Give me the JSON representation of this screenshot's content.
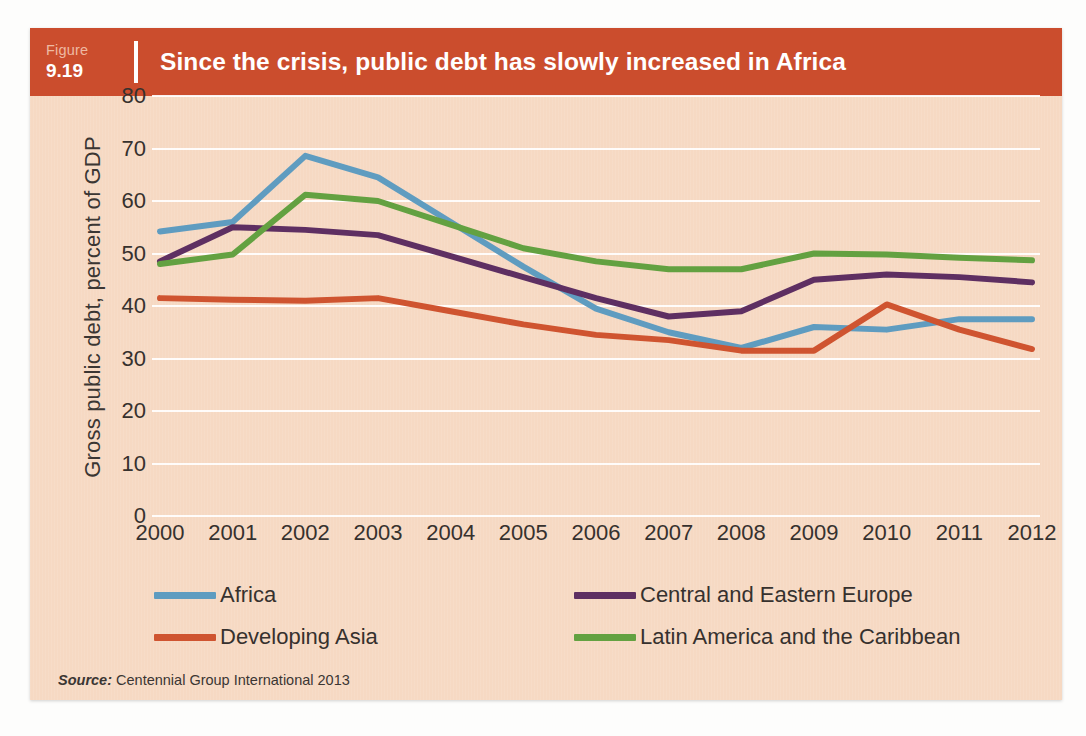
{
  "figure": {
    "label_word": "Figure",
    "number": "9.19",
    "title": "Since the crisis, public debt has slowly increased in Africa"
  },
  "source": {
    "prefix": "Source:",
    "text": "Centennial Group International 2013"
  },
  "colors": {
    "header_band": "#cb4d2d",
    "panel_background": "#f6d9c3",
    "gridline": "#ffffff",
    "africa": "#5f9cc0",
    "central_eastern_europe": "#5e2f62",
    "developing_asia": "#cf5430",
    "latin_america_caribbean": "#63a141"
  },
  "chart_data": {
    "type": "line",
    "title": "Since the crisis, public debt has slowly increased in Africa",
    "xlabel": "",
    "ylabel": "Gross public debt, percent of GDP",
    "grid": true,
    "legend_position": "bottom",
    "ylim": [
      0,
      80
    ],
    "yticks": [
      80,
      70,
      60,
      50,
      40,
      30,
      20,
      10,
      0
    ],
    "categories": [
      "2000",
      "2001",
      "2002",
      "2003",
      "2004",
      "2005",
      "2006",
      "2007",
      "2008",
      "2009",
      "2010",
      "2011",
      "2012"
    ],
    "x": [
      2000,
      2001,
      2002,
      2003,
      2004,
      2005,
      2006,
      2007,
      2008,
      2009,
      2010,
      2011,
      2012
    ],
    "series": [
      {
        "name": "Africa",
        "color": "#5f9cc0",
        "values": [
          54.2,
          56.0,
          68.6,
          64.5,
          56.0,
          47.5,
          39.5,
          35.0,
          32.0,
          36.0,
          35.5,
          37.5,
          37.5
        ]
      },
      {
        "name": "Central and Eastern Europe",
        "color": "#5e2f62",
        "values": [
          48.5,
          55.0,
          54.5,
          53.5,
          49.5,
          45.5,
          41.5,
          38.0,
          39.0,
          45.0,
          46.0,
          45.5,
          44.5
        ]
      },
      {
        "name": "Developing Asia",
        "color": "#cf5430",
        "values": [
          41.5,
          41.2,
          41.0,
          41.5,
          39.0,
          36.5,
          34.5,
          33.5,
          31.5,
          31.5,
          40.3,
          35.5,
          31.8
        ]
      },
      {
        "name": "Latin America and the Caribbean",
        "color": "#63a141",
        "values": [
          48.0,
          49.8,
          61.2,
          60.0,
          55.5,
          51.0,
          48.5,
          47.0,
          47.0,
          50.0,
          49.8,
          49.2,
          48.7
        ]
      }
    ]
  },
  "legend": {
    "items": [
      {
        "label": "Africa",
        "color": "#5f9cc0"
      },
      {
        "label": "Central and Eastern Europe",
        "color": "#5e2f62"
      },
      {
        "label": "Developing Asia",
        "color": "#cf5430"
      },
      {
        "label": "Latin America and the Caribbean",
        "color": "#63a141"
      }
    ]
  }
}
